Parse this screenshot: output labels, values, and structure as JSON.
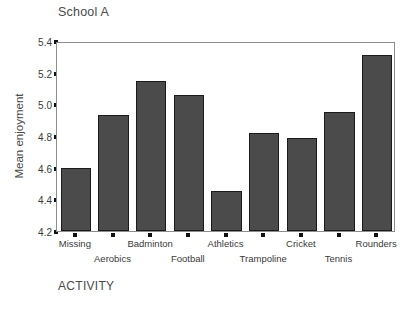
{
  "chart_data": {
    "type": "bar",
    "title": "School A",
    "xlabel": "ACTIVITY",
    "ylabel": "Mean enjoyment",
    "categories": [
      "Missing",
      "Aerobics",
      "Badminton",
      "Football",
      "Athletics",
      "Trampoline",
      "Cricket",
      "Tennis",
      "Rounders"
    ],
    "values": [
      4.6,
      4.93,
      5.15,
      5.06,
      4.45,
      4.82,
      4.79,
      4.95,
      5.31
    ],
    "ylim": [
      4.2,
      5.4
    ],
    "yticks": [
      4.2,
      4.4,
      4.6,
      4.8,
      5.0,
      5.2,
      5.4
    ],
    "ytick_labels": [
      "4.2",
      "4.4",
      "4.6",
      "4.8",
      "5.0",
      "5.2",
      "5.4"
    ],
    "grid": false,
    "legend": false,
    "bar_color": "#4b4b4b",
    "bar_edge_color": "#1b1b1b",
    "frame_color": "#8d8d8d",
    "text_color": "#3a3a3a"
  },
  "labels": {
    "cat_0": "Missing",
    "cat_1": "Aerobics",
    "cat_2": "Badminton",
    "cat_3": "Football",
    "cat_4": "Athletics",
    "cat_5": "Trampoline",
    "cat_6": "Cricket",
    "cat_7": "Tennis",
    "cat_8": "Rounders"
  },
  "ytick_text": {
    "t0": "4.2",
    "t1": "4.4",
    "t2": "4.6",
    "t3": "4.8",
    "t4": "5.0",
    "t5": "5.2",
    "t6": "5.4"
  }
}
